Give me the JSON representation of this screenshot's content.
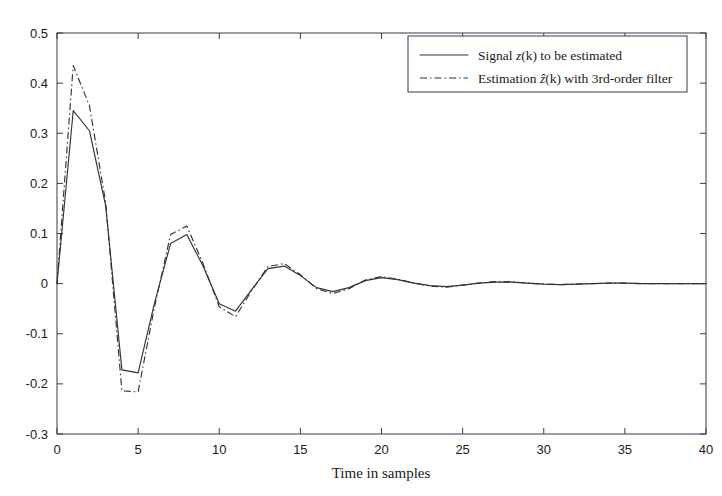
{
  "chart_data": {
    "type": "line",
    "title": "",
    "xlabel": "Time in samples",
    "ylabel": "",
    "xlim": [
      0,
      40
    ],
    "ylim": [
      -0.3,
      0.5
    ],
    "xticks": [
      0,
      5,
      10,
      15,
      20,
      25,
      30,
      35,
      40
    ],
    "xtick_labels": [
      "0",
      "5",
      "10",
      "15",
      "20",
      "25",
      "30",
      "35",
      "40"
    ],
    "yticks": [
      -0.3,
      -0.2,
      -0.1,
      0,
      0.1,
      0.2,
      0.3,
      0.4,
      0.5
    ],
    "ytick_labels": [
      "-0.3",
      "-0.2",
      "-0.1",
      "0",
      "0.1",
      "0.2",
      "0.3",
      "0.4",
      "0.5"
    ],
    "grid": false,
    "legend_position": "upper right",
    "x": [
      0,
      1,
      2,
      3,
      4,
      5,
      6,
      7,
      8,
      9,
      10,
      11,
      12,
      13,
      14,
      15,
      16,
      17,
      18,
      19,
      20,
      21,
      22,
      23,
      24,
      25,
      26,
      27,
      28,
      29,
      30,
      31,
      32,
      33,
      34,
      35,
      36,
      37,
      38,
      39,
      40
    ],
    "series": [
      {
        "name": "Signal z(k) to be estimated",
        "style": "solid",
        "color": "#333333",
        "values": [
          0.0,
          0.345,
          0.305,
          0.155,
          -0.172,
          -0.178,
          -0.04,
          0.08,
          0.098,
          0.035,
          -0.04,
          -0.055,
          -0.012,
          0.03,
          0.035,
          0.016,
          -0.008,
          -0.016,
          -0.008,
          0.006,
          0.012,
          0.008,
          0.001,
          -0.004,
          -0.006,
          -0.003,
          0.001,
          0.003,
          0.003,
          0.001,
          -0.001,
          -0.002,
          -0.001,
          0.0,
          0.001,
          0.001,
          0.0,
          0.0,
          0.0,
          0.0,
          0.0
        ]
      },
      {
        "name": "Estimation ẑ(k) with 3rd-order filter",
        "style": "dashdot",
        "color": "#333333",
        "values": [
          0.0,
          0.435,
          0.355,
          0.162,
          -0.214,
          -0.216,
          -0.048,
          0.098,
          0.115,
          0.04,
          -0.046,
          -0.066,
          -0.014,
          0.034,
          0.04,
          0.018,
          -0.01,
          -0.02,
          -0.01,
          0.007,
          0.014,
          0.009,
          0.001,
          -0.005,
          -0.007,
          -0.003,
          0.001,
          0.004,
          0.004,
          0.001,
          -0.001,
          -0.002,
          -0.001,
          0.0,
          0.001,
          0.001,
          0.0,
          0.0,
          0.0,
          0.0,
          0.0
        ]
      }
    ],
    "legend": [
      {
        "label": "Signal z(k) to be estimated",
        "label_prefix": "Signal ",
        "label_var": "z",
        "label_suffix": "(k) to be estimated",
        "style": "solid"
      },
      {
        "label": "Estimation ẑ(k) with 3rd-order filter",
        "label_prefix": "Estimation ",
        "label_var": "ẑ",
        "label_suffix": "(k) with 3rd-order filter",
        "style": "dashdot"
      }
    ]
  },
  "axes": {
    "x_axis_title": "Time in samples"
  }
}
